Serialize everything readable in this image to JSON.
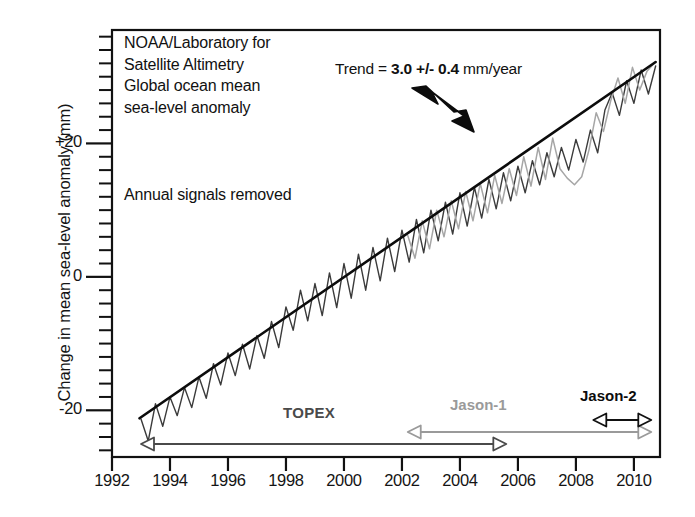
{
  "figure": {
    "background": "#ffffff",
    "frame_color": "#111111"
  },
  "caption": {
    "line1": "NOAA/Laboratory for",
    "line2": "Satellite Altimetry",
    "line3": "Global ocean mean",
    "line4": "sea-level anomaly",
    "note": "Annual signals removed"
  },
  "trend": {
    "prefix": "Trend = ",
    "value": "3.0 +/- 0.4",
    "suffix": " mm/year"
  },
  "missions": [
    {
      "name": "TOPEX",
      "label": "TOPEX",
      "color": "#4a4a4a",
      "start": 1993.0,
      "end": 2005.6,
      "row_y": 444
    },
    {
      "name": "Jason-1",
      "label": "Jason-1",
      "color": "#9a9a9a",
      "start": 2002.2,
      "end": 2010.6,
      "row_y": 432
    },
    {
      "name": "Jason-2",
      "label": "Jason-2",
      "color": "#111111",
      "start": 2008.6,
      "end": 2010.6,
      "row_y": 420
    }
  ],
  "chart_data": {
    "type": "line",
    "title": "NOAA/Laboratory for Satellite Altimetry Global ocean mean sea-level anomaly",
    "subtitle": "Annual signals removed",
    "xlabel": "",
    "ylabel": "Change in mean sea-level anomaly (mm)",
    "xlim": [
      1992,
      2010.9
    ],
    "ylim": [
      -27,
      37
    ],
    "grid": false,
    "legend_position": "none",
    "xticks": [
      1992,
      1994,
      1996,
      1998,
      2000,
      2002,
      2004,
      2006,
      2008,
      2010
    ],
    "xticklabels": [
      "1992",
      "1994",
      "1996",
      "1998",
      "2000",
      "2002",
      "2004",
      "2006",
      "2008",
      "2010"
    ],
    "yticks": [
      -20,
      0,
      20
    ],
    "yticklabels": [
      "-20",
      "0",
      "+20"
    ],
    "y_minor_tick_step": 2,
    "annotations": [
      {
        "text": "Trend = 3.0 +/- 0.4 mm/year",
        "x": 2004.0,
        "y": 33.5,
        "arrow_to_x": 2007.4,
        "arrow_to_y": 22.5
      }
    ],
    "series": [
      {
        "name": "Trend line",
        "type": "line",
        "color": "#0c0c0c",
        "width": 2.6,
        "x": [
          1992.95,
          2010.75
        ],
        "values": [
          -21.2,
          32.2
        ]
      },
      {
        "name": "TOPEX sea level anomaly",
        "type": "line",
        "color": "#3b3b3b",
        "width": 1.4,
        "x": [
          1993.0,
          1993.25,
          1993.5,
          1993.75,
          1994.0,
          1994.25,
          1994.5,
          1994.75,
          1995.0,
          1995.25,
          1995.5,
          1995.75,
          1996.0,
          1996.25,
          1996.5,
          1996.75,
          1997.0,
          1997.25,
          1997.5,
          1997.75,
          1998.0,
          1998.25,
          1998.5,
          1998.75,
          1999.0,
          1999.25,
          1999.5,
          1999.75,
          2000.0,
          2000.25,
          2000.5,
          2000.75,
          2001.0,
          2001.25,
          2001.5,
          2001.75,
          2002.0,
          2002.25,
          2002.5,
          2002.75,
          2003.0,
          2003.25,
          2003.5,
          2003.75,
          2004.0,
          2004.25,
          2004.5,
          2004.75,
          2005.0,
          2005.25,
          2005.5,
          2005.75,
          2006.0,
          2006.25,
          2006.5,
          2006.75,
          2007.0,
          2007.25,
          2007.5,
          2007.75,
          2008.0,
          2008.25,
          2008.5,
          2008.75,
          2009.0,
          2009.25,
          2009.5,
          2009.75,
          2010.0,
          2010.25,
          2010.5,
          2010.75
        ],
        "values": [
          -21.3,
          -24.6,
          -19.0,
          -22.4,
          -18.0,
          -20.8,
          -16.6,
          -19.6,
          -15.0,
          -18.2,
          -13.0,
          -16.2,
          -11.4,
          -14.8,
          -10.1,
          -13.8,
          -8.8,
          -12.2,
          -6.7,
          -10.6,
          -4.5,
          -8.0,
          -2.0,
          -6.6,
          -1.0,
          -5.8,
          0.6,
          -4.6,
          2.0,
          -3.2,
          3.4,
          -2.0,
          4.4,
          -0.6,
          5.8,
          0.8,
          7.0,
          2.2,
          8.6,
          3.6,
          10.0,
          5.4,
          11.2,
          6.4,
          12.6,
          7.6,
          13.4,
          8.8,
          14.6,
          10.2,
          15.6,
          11.4,
          16.6,
          12.6,
          17.4,
          13.8,
          18.6,
          15.0,
          19.4,
          16.0,
          20.6,
          17.2,
          22.0,
          18.6,
          25.0,
          27.6,
          24.2,
          29.4,
          26.0,
          31.0,
          27.4,
          31.6
        ]
      },
      {
        "name": "Jason-1 sea level anomaly",
        "type": "line",
        "color": "#a6a6a6",
        "width": 1.5,
        "x": [
          2002.2,
          2002.45,
          2002.7,
          2002.95,
          2003.2,
          2003.45,
          2003.7,
          2003.95,
          2004.2,
          2004.45,
          2004.7,
          2004.95,
          2005.2,
          2005.45,
          2005.7,
          2005.95,
          2006.2,
          2006.45,
          2006.7,
          2006.95,
          2007.2,
          2007.45,
          2007.7,
          2007.95,
          2008.2,
          2008.45,
          2008.7,
          2008.95,
          2009.2,
          2009.45,
          2009.7,
          2009.95,
          2010.2,
          2010.45,
          2010.7
        ],
        "values": [
          6.2,
          2.8,
          8.4,
          4.2,
          10.0,
          6.0,
          11.4,
          7.2,
          12.8,
          8.4,
          14.0,
          9.6,
          15.2,
          11.0,
          16.2,
          12.2,
          18.0,
          13.6,
          19.4,
          14.6,
          20.8,
          16.2,
          14.8,
          13.8,
          15.0,
          19.0,
          24.6,
          21.8,
          26.4,
          29.8,
          26.0,
          31.4,
          28.0,
          30.8,
          32.0
        ]
      }
    ]
  }
}
